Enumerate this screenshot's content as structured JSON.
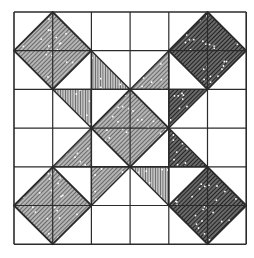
{
  "figure": {
    "grid": {
      "cols": 6,
      "rows": 6,
      "origin_x": 14,
      "origin_y": 12,
      "cell": 38.7
    },
    "colors": {
      "background": "#ffffff",
      "line": "#2b2b2b",
      "medium_fill": "#8a8a8a",
      "dark_fill": "#4a4a4a",
      "stripe_fill": "#9a9a9a",
      "dot": "#ffffff"
    },
    "diamonds": [
      {
        "name": "top-left-diamond",
        "cx": 1,
        "cy": 1,
        "tone": "medium"
      },
      {
        "name": "top-right-diamond",
        "cx": 5,
        "cy": 1,
        "tone": "dark"
      },
      {
        "name": "center-diamond",
        "cx": 3,
        "cy": 3,
        "tone": "medium"
      },
      {
        "name": "bottom-left-diamond",
        "cx": 1,
        "cy": 5,
        "tone": "medium"
      },
      {
        "name": "bottom-right-diamond",
        "cx": 5,
        "cy": 5,
        "tone": "dark"
      }
    ],
    "triangles": [
      {
        "name": "triangle-r1c2",
        "points": [
          [
            2,
            1
          ],
          [
            2,
            2
          ],
          [
            3,
            2
          ]
        ],
        "tone": "stripe"
      },
      {
        "name": "triangle-r2c1",
        "points": [
          [
            1,
            2
          ],
          [
            2,
            2
          ],
          [
            2,
            3
          ]
        ],
        "tone": "stripe"
      },
      {
        "name": "triangle-r1c3",
        "points": [
          [
            4,
            1
          ],
          [
            4,
            2
          ],
          [
            3,
            2
          ]
        ],
        "tone": "medium"
      },
      {
        "name": "triangle-r2c4",
        "points": [
          [
            4,
            2
          ],
          [
            5,
            2
          ],
          [
            4,
            3
          ]
        ],
        "tone": "dark"
      },
      {
        "name": "triangle-r3c1",
        "points": [
          [
            2,
            3
          ],
          [
            2,
            4
          ],
          [
            1,
            4
          ]
        ],
        "tone": "medium"
      },
      {
        "name": "triangle-r4c2",
        "points": [
          [
            2,
            4
          ],
          [
            3,
            4
          ],
          [
            2,
            5
          ]
        ],
        "tone": "medium"
      },
      {
        "name": "triangle-r3c4",
        "points": [
          [
            4,
            3
          ],
          [
            4,
            4
          ],
          [
            5,
            4
          ]
        ],
        "tone": "dark"
      },
      {
        "name": "triangle-r4c3",
        "points": [
          [
            3,
            4
          ],
          [
            4,
            4
          ],
          [
            4,
            5
          ]
        ],
        "tone": "stripe"
      }
    ]
  }
}
